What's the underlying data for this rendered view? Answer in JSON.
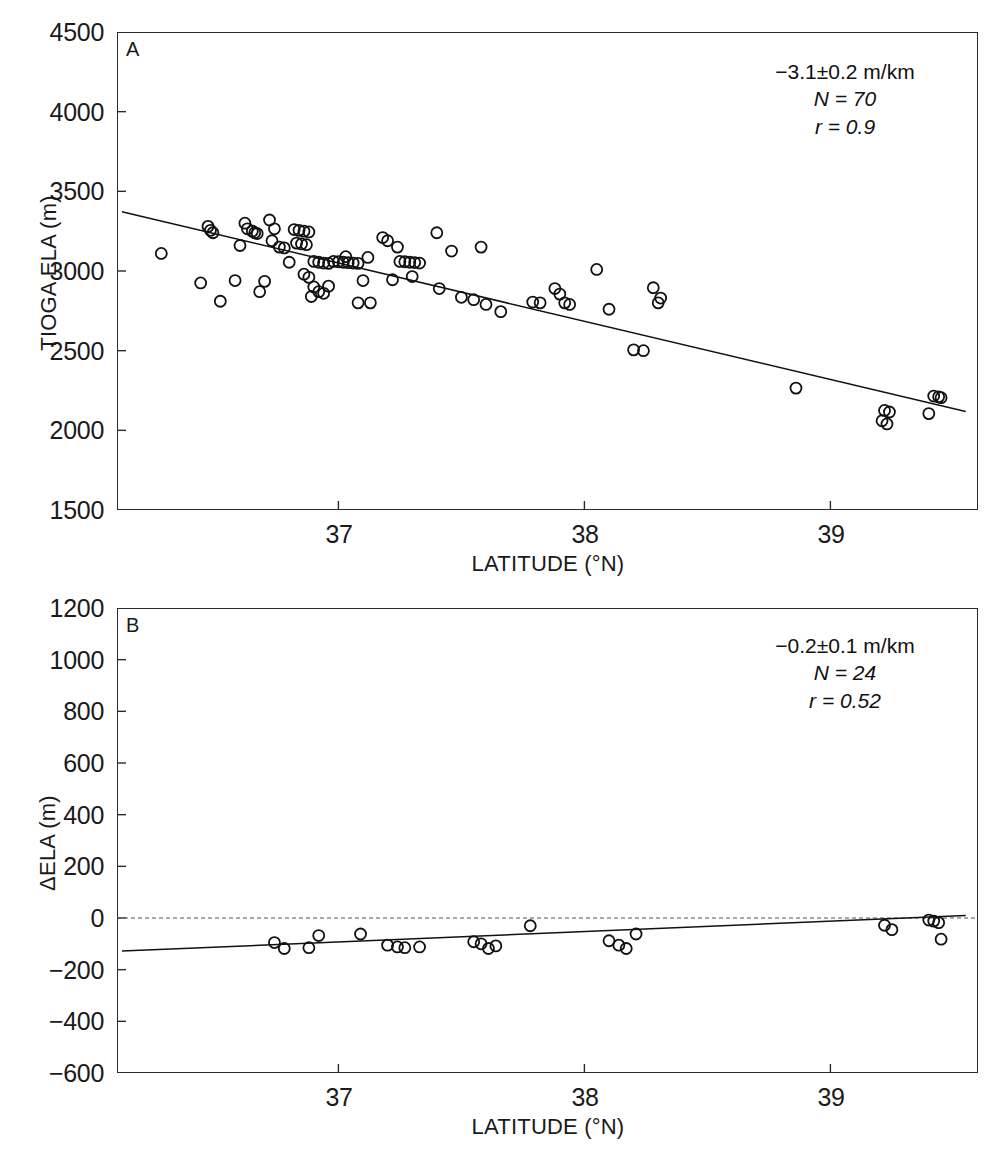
{
  "figure": {
    "width": 998,
    "height": 1151,
    "background": "#ffffff",
    "ink_color": "#1a1a1a"
  },
  "chart_data": [
    {
      "type": "scatter",
      "panel_label": "A",
      "title": "",
      "xlabel": "LATITUDE (°N)",
      "ylabel": "TIOGA ELA (m)",
      "xlim": [
        36.1,
        39.6
      ],
      "ylim": [
        1500,
        4500
      ],
      "xticks": [
        37,
        38,
        39
      ],
      "xtick_labels": [
        "37",
        "38",
        "39"
      ],
      "yticks": [
        1500,
        2000,
        2500,
        3000,
        3500,
        4000,
        4500
      ],
      "ytick_labels": [
        "1500",
        "2000",
        "2500",
        "3000",
        "3500",
        "4000",
        "4500"
      ],
      "grid": false,
      "legend": "none",
      "marker": "open-circle",
      "marker_size_px": 11,
      "annotations": {
        "slope": "−3.1±0.2 m/km",
        "n": "N = 70",
        "r": "r = 0.9"
      },
      "trend_line": {
        "style": "solid",
        "x": [
          36.12,
          39.55
        ],
        "y": [
          3372,
          2118
        ]
      },
      "points": [
        [
          36.28,
          3110
        ],
        [
          36.47,
          3280
        ],
        [
          36.48,
          3255
        ],
        [
          36.49,
          3240
        ],
        [
          36.44,
          2925
        ],
        [
          36.52,
          2810
        ],
        [
          36.62,
          3300
        ],
        [
          36.63,
          3265
        ],
        [
          36.65,
          3250
        ],
        [
          36.66,
          3240
        ],
        [
          36.67,
          3235
        ],
        [
          36.6,
          3160
        ],
        [
          36.58,
          2940
        ],
        [
          36.72,
          3320
        ],
        [
          36.74,
          3265
        ],
        [
          36.73,
          3190
        ],
        [
          36.76,
          3150
        ],
        [
          36.78,
          3145
        ],
        [
          36.7,
          2935
        ],
        [
          36.68,
          2870
        ],
        [
          36.82,
          3260
        ],
        [
          36.84,
          3255
        ],
        [
          36.86,
          3250
        ],
        [
          36.88,
          3245
        ],
        [
          36.83,
          3175
        ],
        [
          36.85,
          3170
        ],
        [
          36.87,
          3165
        ],
        [
          36.8,
          3055
        ],
        [
          36.9,
          3060
        ],
        [
          36.92,
          3055
        ],
        [
          36.94,
          3050
        ],
        [
          36.96,
          3048
        ],
        [
          36.86,
          2980
        ],
        [
          36.88,
          2960
        ],
        [
          36.9,
          2900
        ],
        [
          36.92,
          2870
        ],
        [
          36.94,
          2860
        ],
        [
          36.89,
          2840
        ],
        [
          36.96,
          2905
        ],
        [
          36.98,
          3060
        ],
        [
          37.0,
          3058
        ],
        [
          37.02,
          3055
        ],
        [
          37.04,
          3052
        ],
        [
          37.06,
          3050
        ],
        [
          37.08,
          3048
        ],
        [
          37.03,
          3090
        ],
        [
          37.12,
          3085
        ],
        [
          37.1,
          2940
        ],
        [
          37.08,
          2800
        ],
        [
          37.13,
          2800
        ],
        [
          37.18,
          3210
        ],
        [
          37.2,
          3190
        ],
        [
          37.25,
          3060
        ],
        [
          37.27,
          3058
        ],
        [
          37.29,
          3055
        ],
        [
          37.31,
          3053
        ],
        [
          37.33,
          3050
        ],
        [
          37.24,
          3150
        ],
        [
          37.3,
          2965
        ],
        [
          37.22,
          2945
        ],
        [
          37.4,
          3240
        ],
        [
          37.46,
          3125
        ],
        [
          37.41,
          2890
        ],
        [
          37.5,
          2835
        ],
        [
          37.58,
          3150
        ],
        [
          37.55,
          2820
        ],
        [
          37.6,
          2790
        ],
        [
          37.66,
          2745
        ],
        [
          37.79,
          2805
        ],
        [
          37.82,
          2800
        ],
        [
          37.88,
          2890
        ],
        [
          37.9,
          2855
        ],
        [
          37.92,
          2800
        ],
        [
          37.94,
          2790
        ],
        [
          38.05,
          3010
        ],
        [
          38.1,
          2760
        ],
        [
          38.2,
          2505
        ],
        [
          38.24,
          2500
        ],
        [
          38.28,
          2895
        ],
        [
          38.31,
          2830
        ],
        [
          38.3,
          2800
        ],
        [
          38.86,
          2265
        ],
        [
          39.22,
          2125
        ],
        [
          39.24,
          2115
        ],
        [
          39.21,
          2060
        ],
        [
          39.23,
          2040
        ],
        [
          39.42,
          2215
        ],
        [
          39.44,
          2210
        ],
        [
          39.45,
          2205
        ],
        [
          39.4,
          2105
        ]
      ]
    },
    {
      "type": "scatter",
      "panel_label": "B",
      "title": "",
      "xlabel": "LATITUDE (°N)",
      "ylabel": "ΔELA (m)",
      "xlim": [
        36.1,
        39.6
      ],
      "ylim": [
        -600,
        1200
      ],
      "xticks": [
        37,
        38,
        39
      ],
      "xtick_labels": [
        "37",
        "38",
        "39"
      ],
      "yticks": [
        -600,
        -400,
        -200,
        0,
        200,
        400,
        600,
        800,
        1000,
        1200
      ],
      "ytick_labels": [
        "−600",
        "−400",
        "−200",
        "0",
        "200",
        "400",
        "600",
        "800",
        "1000",
        "1200"
      ],
      "grid": false,
      "legend": "none",
      "marker": "open-circle",
      "marker_size_px": 11,
      "annotations": {
        "slope": "−0.2±0.1 m/km",
        "n": "N = 24",
        "r": "r = 0.52"
      },
      "zero_line": {
        "style": "dashed",
        "y": 0
      },
      "trend_line": {
        "style": "solid",
        "x": [
          36.12,
          39.55
        ],
        "y": [
          -128,
          10
        ]
      },
      "points": [
        [
          36.74,
          -95
        ],
        [
          36.78,
          -118
        ],
        [
          36.88,
          -115
        ],
        [
          36.92,
          -68
        ],
        [
          37.09,
          -62
        ],
        [
          37.2,
          -105
        ],
        [
          37.24,
          -112
        ],
        [
          37.27,
          -115
        ],
        [
          37.33,
          -112
        ],
        [
          37.55,
          -92
        ],
        [
          37.58,
          -100
        ],
        [
          37.61,
          -118
        ],
        [
          37.64,
          -108
        ],
        [
          37.78,
          -30
        ],
        [
          38.1,
          -88
        ],
        [
          38.14,
          -105
        ],
        [
          38.17,
          -118
        ],
        [
          38.21,
          -62
        ],
        [
          39.22,
          -28
        ],
        [
          39.25,
          -45
        ],
        [
          39.4,
          -8
        ],
        [
          39.42,
          -12
        ],
        [
          39.44,
          -18
        ],
        [
          39.45,
          -82
        ]
      ]
    }
  ]
}
